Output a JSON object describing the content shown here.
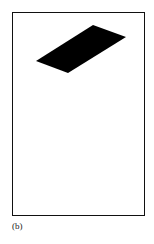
{
  "figure": {
    "caption": "(b)",
    "frame_color": "#111111",
    "shape": {
      "type": "parallelogram",
      "fill": "#000000",
      "points": "93,25 126,37 68,73 36,61"
    }
  }
}
